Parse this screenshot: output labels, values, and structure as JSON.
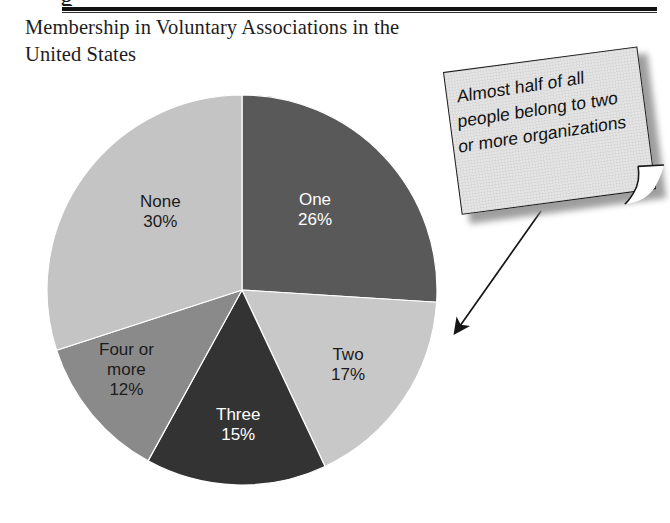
{
  "header": {
    "title": "Membership in Voluntary Associations in the United States",
    "clipped_glyph": "g",
    "rule_color": "#121212"
  },
  "annotation": {
    "text": "Almost half of all people belong to two or more organizations",
    "paper_color": "#e4e4e4",
    "border_color": "#1a1a1a",
    "shadow_color": "#8e8e8e",
    "points_to": "two-or-more-slices"
  },
  "chart_data": {
    "type": "pie",
    "title": "Membership in Voluntary Associations in the United States",
    "xlabel": "",
    "ylabel": "",
    "legend": "none",
    "labels_inside": true,
    "start_angle_deg": 0,
    "direction": "clockwise",
    "center": [
      242,
      290
    ],
    "radius": 195,
    "categories": [
      "One",
      "Two",
      "Three",
      "Four or more",
      "None"
    ],
    "values": [
      26,
      17,
      15,
      12,
      30
    ],
    "value_suffix": "%",
    "colors": [
      "#595959",
      "#c8c8c8",
      "#333333",
      "#8a8a8a",
      "#c4c4c4"
    ],
    "slices": [
      {
        "name": "One",
        "label": "One",
        "value": 26,
        "value_label": "26%",
        "color": "#595959",
        "text_color": "#ffffff",
        "label_x": 315,
        "label_y": 210
      },
      {
        "name": "Two",
        "label": "Two",
        "value": 17,
        "value_label": "17%",
        "color": "#c8c8c8",
        "text_color": "#1b1b1b",
        "label_x": 348,
        "label_y": 365
      },
      {
        "name": "Three",
        "label": "Three",
        "value": 15,
        "value_label": "15%",
        "color": "#333333",
        "text_color": "#ffffff",
        "label_x": 238,
        "label_y": 425
      },
      {
        "name": "Four or more",
        "label": "Four or\nmore",
        "value": 12,
        "value_label": "12%",
        "color": "#8a8a8a",
        "text_color": "#1b1b1b",
        "label_x": 126,
        "label_y": 370
      },
      {
        "name": "None",
        "label": "None",
        "value": 30,
        "value_label": "30%",
        "color": "#c4c4c4",
        "text_color": "#1b1b1b",
        "label_x": 160,
        "label_y": 212
      }
    ]
  }
}
